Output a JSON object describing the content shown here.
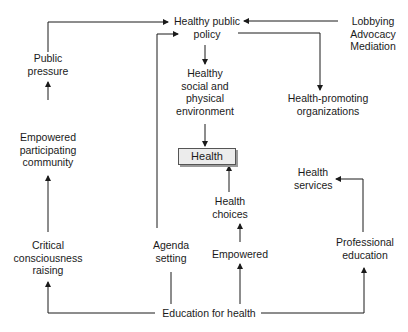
{
  "diagram": {
    "nodes": {
      "healthy_public_policy": [
        "Healthy public",
        "policy"
      ],
      "lobbying": [
        "Lobbying",
        "Advocacy",
        "Mediation"
      ],
      "public_pressure": [
        "Public",
        "pressure"
      ],
      "healthy_environment": [
        "Healthy",
        "social and",
        "physical",
        "environment"
      ],
      "health_promoting_orgs": [
        "Health-promoting",
        "organizations"
      ],
      "empowered_community": [
        "Empowered",
        "participating",
        "community"
      ],
      "health": "Health",
      "health_services": [
        "Health",
        "services"
      ],
      "health_choices": [
        "Health",
        "choices"
      ],
      "critical_consciousness": [
        "Critical",
        "consciousness",
        "raising"
      ],
      "agenda_setting": [
        "Agenda",
        "setting"
      ],
      "empowered": "Empowered",
      "professional_education": [
        "Professional",
        "education"
      ],
      "education_for_health": "Education for health"
    },
    "edges": [
      {
        "from": "Lobbying Advocacy Mediation",
        "to": "Healthy public policy"
      },
      {
        "from": "Public pressure",
        "to": "Healthy public policy"
      },
      {
        "from": "Agenda setting",
        "to": "Healthy public policy"
      },
      {
        "from": "Healthy public policy",
        "to": "Healthy social and physical environment"
      },
      {
        "from": "Healthy public policy",
        "to": "Health-promoting organizations"
      },
      {
        "from": "Healthy social and physical environment",
        "to": "Health"
      },
      {
        "from": "Health choices",
        "to": "Health"
      },
      {
        "from": "Empowered",
        "to": "Health choices"
      },
      {
        "from": "Empowered participating community",
        "to": "Public pressure"
      },
      {
        "from": "Critical consciousness raising",
        "to": "Empowered participating community"
      },
      {
        "from": "Professional education",
        "to": "Health services"
      },
      {
        "from": "Education for health",
        "to": "Critical consciousness raising"
      },
      {
        "from": "Education for health",
        "to": "Agenda setting"
      },
      {
        "from": "Education for health",
        "to": "Empowered"
      },
      {
        "from": "Education for health",
        "to": "Professional education"
      }
    ],
    "colors": {
      "line": "#1a1a1a",
      "health_box_fill": "#ececec",
      "health_box_shadow": "#9a9a9a"
    }
  }
}
